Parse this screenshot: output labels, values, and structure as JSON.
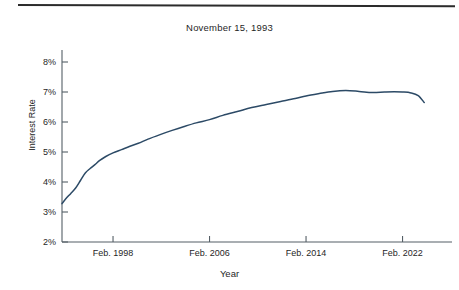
{
  "chart_data": {
    "type": "line",
    "title": "November 15, 1993",
    "xlabel": "Year",
    "ylabel": "Interest Rate",
    "grid": false,
    "legend": "none",
    "line_color": "#2c4a66",
    "axis_color": "#555f66",
    "background": "#ffffff",
    "ylim": [
      2,
      8
    ],
    "ytick_labels": [
      "2%",
      "3%",
      "4%",
      "5%",
      "6%",
      "7%",
      "8%"
    ],
    "ytick_values": [
      2,
      3,
      4,
      5,
      6,
      7,
      8
    ],
    "xtick_labels": [
      "Feb. 1998",
      "Feb. 2006",
      "Feb. 2014",
      "Feb. 2022"
    ],
    "xtick_values": [
      1998.1,
      2006.1,
      2014.1,
      2022.1
    ],
    "xlim": [
      1993.87,
      2026.2
    ],
    "series": [
      {
        "name": "Interest Rate",
        "x": [
          1993.87,
          1994.2,
          1994.6,
          1995.0,
          1995.4,
          1995.8,
          1996.2,
          1996.6,
          1997.0,
          1997.5,
          1998.1,
          1998.8,
          1999.5,
          2000.2,
          2001.0,
          2002.0,
          2003.0,
          2004.0,
          2005.0,
          2006.1,
          2007.2,
          2008.4,
          2009.6,
          2010.8,
          2012.0,
          2013.2,
          2014.1,
          2015.2,
          2016.3,
          2017.4,
          2018.5,
          2019.6,
          2020.6,
          2021.4,
          2022.1,
          2022.8,
          2023.4,
          2023.9
        ],
        "y": [
          3.28,
          3.45,
          3.62,
          3.8,
          4.05,
          4.3,
          4.45,
          4.58,
          4.72,
          4.85,
          4.97,
          5.08,
          5.19,
          5.29,
          5.43,
          5.58,
          5.72,
          5.85,
          5.97,
          6.08,
          6.22,
          6.35,
          6.48,
          6.58,
          6.68,
          6.78,
          6.87,
          6.95,
          7.02,
          7.05,
          7.02,
          6.98,
          7.0,
          7.01,
          7.0,
          6.97,
          6.88,
          6.65
        ],
        "units": "percent"
      }
    ],
    "annotations": {
      "start_value": "3.28%",
      "peak_value": "7.05%",
      "end_value": "6.65%"
    }
  },
  "page": {
    "has_top_rule": true
  }
}
